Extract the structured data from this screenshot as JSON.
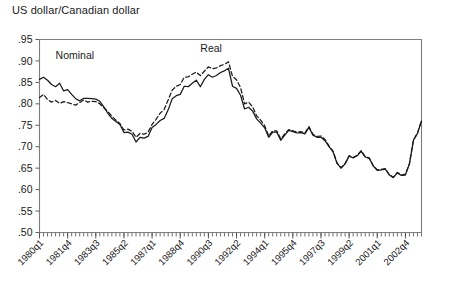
{
  "chart_data": {
    "type": "line",
    "title": "US dollar/Canadian dollar",
    "xlabel": "",
    "ylabel": "",
    "ylim": [
      0.5,
      0.95
    ],
    "ytick_labels": [
      ".95",
      ".90",
      ".85",
      ".80",
      ".75",
      ".70",
      ".65",
      ".60",
      ".55",
      ".50"
    ],
    "ytick_values": [
      0.95,
      0.9,
      0.85,
      0.8,
      0.75,
      0.7,
      0.65,
      0.6,
      0.55,
      0.5
    ],
    "grid": false,
    "legend_position": "inline-annotations",
    "xtick_labels": [
      "1980q1",
      "1981q4",
      "1983q3",
      "1985q2",
      "1987q1",
      "1988q4",
      "1990q3",
      "1992q2",
      "1994q1",
      "1995q4",
      "1997q3",
      "1999q2",
      "2001q1",
      "2002q4"
    ],
    "xtick_indices": [
      0,
      7,
      14,
      21,
      28,
      35,
      42,
      49,
      56,
      63,
      70,
      77,
      84,
      91
    ],
    "x": [
      "1980q1",
      "1980q2",
      "1980q3",
      "1980q4",
      "1981q1",
      "1981q2",
      "1981q3",
      "1981q4",
      "1982q1",
      "1982q2",
      "1982q3",
      "1982q4",
      "1983q1",
      "1983q2",
      "1983q3",
      "1983q4",
      "1984q1",
      "1984q2",
      "1984q3",
      "1984q4",
      "1985q1",
      "1985q2",
      "1985q3",
      "1985q4",
      "1986q1",
      "1986q2",
      "1986q3",
      "1986q4",
      "1987q1",
      "1987q2",
      "1987q3",
      "1987q4",
      "1988q1",
      "1988q2",
      "1988q3",
      "1988q4",
      "1989q1",
      "1989q2",
      "1989q3",
      "1989q4",
      "1990q1",
      "1990q2",
      "1990q3",
      "1990q4",
      "1991q1",
      "1991q2",
      "1991q3",
      "1991q4",
      "1992q1",
      "1992q2",
      "1992q3",
      "1992q4",
      "1993q1",
      "1993q2",
      "1993q3",
      "1993q4",
      "1994q1",
      "1994q2",
      "1994q3",
      "1994q4",
      "1995q1",
      "1995q2",
      "1995q3",
      "1995q4",
      "1996q1",
      "1996q2",
      "1996q3",
      "1996q4",
      "1997q1",
      "1997q2",
      "1997q3",
      "1997q4",
      "1998q1",
      "1998q2",
      "1998q3",
      "1998q4",
      "1999q1",
      "1999q2",
      "1999q3",
      "1999q4",
      "2000q1",
      "2000q2",
      "2000q3",
      "2000q4",
      "2001q1",
      "2001q2",
      "2001q3",
      "2001q4",
      "2002q1",
      "2002q2",
      "2002q3",
      "2002q4",
      "2003q1",
      "2003q2",
      "2003q3",
      "2003q4"
    ],
    "series": [
      {
        "name": "Nominal",
        "style": "solid",
        "label_x_index": 4,
        "label_y": 0.905,
        "values": [
          0.857,
          0.862,
          0.855,
          0.845,
          0.84,
          0.848,
          0.83,
          0.833,
          0.822,
          0.812,
          0.807,
          0.813,
          0.813,
          0.812,
          0.811,
          0.806,
          0.793,
          0.778,
          0.766,
          0.759,
          0.752,
          0.733,
          0.734,
          0.729,
          0.711,
          0.722,
          0.72,
          0.724,
          0.745,
          0.752,
          0.761,
          0.766,
          0.786,
          0.812,
          0.819,
          0.822,
          0.841,
          0.84,
          0.848,
          0.855,
          0.84,
          0.857,
          0.868,
          0.862,
          0.866,
          0.873,
          0.877,
          0.883,
          0.841,
          0.836,
          0.82,
          0.788,
          0.792,
          0.783,
          0.765,
          0.755,
          0.744,
          0.722,
          0.734,
          0.734,
          0.715,
          0.727,
          0.738,
          0.735,
          0.732,
          0.733,
          0.73,
          0.745,
          0.727,
          0.722,
          0.722,
          0.714,
          0.7,
          0.688,
          0.661,
          0.65,
          0.66,
          0.678,
          0.674,
          0.679,
          0.689,
          0.676,
          0.673,
          0.655,
          0.645,
          0.646,
          0.648,
          0.634,
          0.628,
          0.639,
          0.633,
          0.634,
          0.66,
          0.715,
          0.731,
          0.76
        ]
      },
      {
        "name": "Real",
        "style": "dashed",
        "label_x_index": 40,
        "label_y": 0.92,
        "values": [
          0.815,
          0.822,
          0.81,
          0.804,
          0.808,
          0.801,
          0.805,
          0.803,
          0.8,
          0.797,
          0.803,
          0.809,
          0.804,
          0.806,
          0.805,
          0.8,
          0.791,
          0.782,
          0.771,
          0.762,
          0.754,
          0.739,
          0.741,
          0.736,
          0.722,
          0.731,
          0.729,
          0.734,
          0.752,
          0.764,
          0.778,
          0.787,
          0.809,
          0.832,
          0.841,
          0.845,
          0.862,
          0.863,
          0.869,
          0.874,
          0.866,
          0.876,
          0.886,
          0.882,
          0.884,
          0.889,
          0.892,
          0.898,
          0.864,
          0.856,
          0.838,
          0.8,
          0.804,
          0.793,
          0.772,
          0.762,
          0.749,
          0.725,
          0.737,
          0.737,
          0.718,
          0.73,
          0.74,
          0.737,
          0.734,
          0.735,
          0.732,
          0.747,
          0.729,
          0.724,
          0.725,
          0.717,
          0.702,
          0.69,
          0.662,
          0.651,
          0.661,
          0.679,
          0.675,
          0.68,
          0.691,
          0.677,
          0.674,
          0.656,
          0.646,
          0.647,
          0.649,
          0.635,
          0.629,
          0.64,
          0.634,
          0.636,
          0.661,
          0.716,
          0.732,
          0.761
        ]
      }
    ]
  },
  "axes": {
    "color_axis": "#7d7d7d",
    "color_line": "#1a1a1a"
  }
}
